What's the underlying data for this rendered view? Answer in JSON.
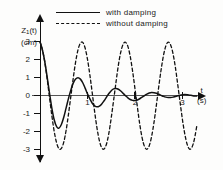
{
  "chart_data": {
    "type": "line",
    "title": "",
    "xlabel": "t",
    "xunit": "(s)",
    "ylabel": "Z₁(t)",
    "yunit": "(cm)",
    "xlim": [
      0,
      3.35
    ],
    "ylim": [
      -3.6,
      3.6
    ],
    "xticks": [
      1,
      2,
      3
    ],
    "xtick_labels": [
      "1",
      "2",
      "3"
    ],
    "yticks": [
      3,
      2,
      1,
      0,
      -1,
      -2,
      -3
    ],
    "ytick_labels": [
      "3",
      "2",
      "1",
      "0",
      "-1",
      "-2",
      "-3"
    ],
    "grid": false,
    "legend_position": "top-center",
    "series": [
      {
        "name": "with damping",
        "style": "solid",
        "color": "#111111",
        "description": "Exponentially damped cosine starting at 3 cm, decaying toward 0",
        "amplitude_envelope": [
          3.0,
          1.8,
          1.0,
          0.62,
          0.4,
          0.27,
          0.18,
          0.1,
          0.05
        ],
        "period": 0.73,
        "points": [
          [
            0.0,
            3.0
          ],
          [
            0.05,
            2.55
          ],
          [
            0.1,
            1.9
          ],
          [
            0.15,
            1.05
          ],
          [
            0.2,
            0.15
          ],
          [
            0.25,
            -0.7
          ],
          [
            0.3,
            -1.35
          ],
          [
            0.35,
            -1.72
          ],
          [
            0.4,
            -1.8
          ],
          [
            0.45,
            -1.6
          ],
          [
            0.5,
            -1.2
          ],
          [
            0.55,
            -0.68
          ],
          [
            0.6,
            -0.15
          ],
          [
            0.65,
            0.32
          ],
          [
            0.7,
            0.7
          ],
          [
            0.75,
            0.93
          ],
          [
            0.8,
            1.0
          ],
          [
            0.85,
            0.92
          ],
          [
            0.9,
            0.72
          ],
          [
            0.95,
            0.42
          ],
          [
            1.0,
            0.1
          ],
          [
            1.05,
            -0.18
          ],
          [
            1.1,
            -0.42
          ],
          [
            1.15,
            -0.56
          ],
          [
            1.2,
            -0.62
          ],
          [
            1.25,
            -0.58
          ],
          [
            1.3,
            -0.46
          ],
          [
            1.35,
            -0.28
          ],
          [
            1.4,
            -0.08
          ],
          [
            1.45,
            0.12
          ],
          [
            1.5,
            0.28
          ],
          [
            1.55,
            0.38
          ],
          [
            1.6,
            0.4
          ],
          [
            1.65,
            0.36
          ],
          [
            1.7,
            0.26
          ],
          [
            1.75,
            0.13
          ],
          [
            1.8,
            0.0
          ],
          [
            1.85,
            -0.12
          ],
          [
            1.9,
            -0.21
          ],
          [
            1.95,
            -0.26
          ],
          [
            2.0,
            -0.27
          ],
          [
            2.05,
            -0.24
          ],
          [
            2.1,
            -0.17
          ],
          [
            2.15,
            -0.08
          ],
          [
            2.2,
            0.01
          ],
          [
            2.25,
            0.09
          ],
          [
            2.3,
            0.15
          ],
          [
            2.35,
            0.18
          ],
          [
            2.4,
            0.17
          ],
          [
            2.45,
            0.14
          ],
          [
            2.5,
            0.08
          ],
          [
            2.55,
            0.02
          ],
          [
            2.6,
            -0.04
          ],
          [
            2.65,
            -0.08
          ],
          [
            2.7,
            -0.1
          ],
          [
            2.75,
            -0.1
          ],
          [
            2.8,
            -0.08
          ],
          [
            2.85,
            -0.04
          ],
          [
            2.9,
            0.0
          ],
          [
            2.95,
            0.03
          ],
          [
            3.0,
            0.05
          ],
          [
            3.05,
            0.06
          ],
          [
            3.1,
            0.05
          ],
          [
            3.15,
            0.03
          ],
          [
            3.2,
            0.01
          ],
          [
            3.25,
            -0.01
          ],
          [
            3.3,
            -0.02
          ]
        ]
      },
      {
        "name": "without damping",
        "style": "dashed",
        "color": "#111111",
        "description": "Undamped cosine of constant 3 cm amplitude",
        "amplitude": 3.0,
        "period": 0.73,
        "points": [
          [
            0.0,
            3.0
          ],
          [
            0.05,
            2.55
          ],
          [
            0.1,
            1.88
          ],
          [
            0.15,
            0.95
          ],
          [
            0.2,
            -0.1
          ],
          [
            0.25,
            -1.12
          ],
          [
            0.3,
            -2.0
          ],
          [
            0.35,
            -2.62
          ],
          [
            0.4,
            -2.95
          ],
          [
            0.45,
            -2.93
          ],
          [
            0.5,
            -2.58
          ],
          [
            0.55,
            -1.92
          ],
          [
            0.6,
            -1.02
          ],
          [
            0.65,
            -0.02
          ],
          [
            0.7,
            0.98
          ],
          [
            0.75,
            1.88
          ],
          [
            0.8,
            2.55
          ],
          [
            0.85,
            2.92
          ],
          [
            0.9,
            2.96
          ],
          [
            0.95,
            2.65
          ],
          [
            1.0,
            2.02
          ],
          [
            1.05,
            1.15
          ],
          [
            1.1,
            0.15
          ],
          [
            1.15,
            -0.88
          ],
          [
            1.2,
            -1.8
          ],
          [
            1.25,
            -2.5
          ],
          [
            1.3,
            -2.9
          ],
          [
            1.35,
            -2.96
          ],
          [
            1.4,
            -2.68
          ],
          [
            1.45,
            -2.08
          ],
          [
            1.5,
            -1.22
          ],
          [
            1.55,
            -0.25
          ],
          [
            1.6,
            0.75
          ],
          [
            1.65,
            1.7
          ],
          [
            1.7,
            2.42
          ],
          [
            1.75,
            2.86
          ],
          [
            1.8,
            2.97
          ],
          [
            1.85,
            2.74
          ],
          [
            1.9,
            2.18
          ],
          [
            1.95,
            1.35
          ],
          [
            2.0,
            0.38
          ],
          [
            2.05,
            -0.62
          ],
          [
            2.1,
            -1.58
          ],
          [
            2.15,
            -2.34
          ],
          [
            2.2,
            -2.82
          ],
          [
            2.25,
            -2.98
          ],
          [
            2.3,
            -2.78
          ],
          [
            2.35,
            -2.26
          ],
          [
            2.4,
            -1.48
          ],
          [
            2.45,
            -0.52
          ],
          [
            2.5,
            0.5
          ],
          [
            2.55,
            1.45
          ],
          [
            2.6,
            2.24
          ],
          [
            2.65,
            2.77
          ],
          [
            2.7,
            2.98
          ],
          [
            2.75,
            2.82
          ],
          [
            2.8,
            2.34
          ],
          [
            2.85,
            1.58
          ],
          [
            2.9,
            0.62
          ],
          [
            2.95,
            -0.38
          ],
          [
            3.0,
            -1.35
          ],
          [
            3.05,
            -2.15
          ],
          [
            3.1,
            -2.72
          ],
          [
            3.15,
            -2.97
          ],
          [
            3.2,
            -2.86
          ],
          [
            3.25,
            -2.42
          ],
          [
            3.3,
            -1.7
          ]
        ]
      }
    ]
  },
  "legend": {
    "items": [
      {
        "label": "with damping",
        "style": "solid"
      },
      {
        "label": "without damping",
        "style": "dashed"
      }
    ]
  },
  "axes": {
    "y_title_main": "Z",
    "y_title_sub": "1",
    "y_title_tail": "(t)",
    "y_title_unit": "(cm)",
    "x_title": "t",
    "x_title_unit": "(s)"
  }
}
